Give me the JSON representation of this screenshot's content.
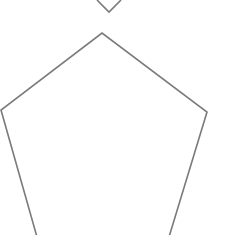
{
  "diagram": {
    "background": "#ffffff",
    "stroke_color": "#7a7a7a",
    "stroke_width": 1.6,
    "shapes": [
      {
        "name": "top-shape-partial",
        "type": "polyline",
        "points": "97,0 109,12 121,0"
      },
      {
        "name": "pentagon",
        "type": "polyline",
        "points": "37,237 1,110 102,33 207,112 169,237"
      }
    ]
  }
}
